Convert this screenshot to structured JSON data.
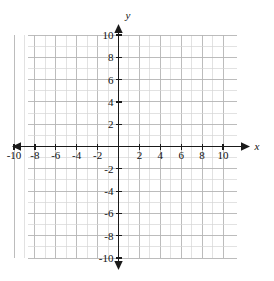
{
  "figure": {
    "kind": "cartesian-coordinate-grid",
    "background_color": "#ffffff",
    "grid_color": "#b5b5b5",
    "grid_color_minor": "#d6d6d6",
    "axis_color": "#1a1a1a",
    "label_color": "#111111"
  },
  "axes": {
    "x": {
      "name": "x",
      "min": -10,
      "max": 10,
      "step": 1,
      "tick_label_step": 2,
      "tick_labels": [
        "-10",
        "-8",
        "-6",
        "-4",
        "-2",
        "2",
        "4",
        "6",
        "8",
        "10"
      ],
      "tick_values": [
        -10,
        -8,
        -6,
        -4,
        -2,
        2,
        4,
        6,
        8,
        10
      ],
      "arrows": "both"
    },
    "y": {
      "name": "y",
      "min": -10,
      "max": 10,
      "step": 1,
      "tick_label_step": 2,
      "tick_labels": [
        "10",
        "8",
        "6",
        "4",
        "2",
        "-2",
        "-4",
        "-6",
        "-8",
        "-10"
      ],
      "tick_values": [
        10,
        8,
        6,
        4,
        2,
        -2,
        -4,
        -6,
        -8,
        -10
      ],
      "arrows": "both"
    }
  },
  "chart_data": {
    "type": "scatter",
    "title": "",
    "xlabel": "x",
    "ylabel": "y",
    "xlim": [
      -10,
      10
    ],
    "ylim": [
      -10,
      10
    ],
    "xticks": [
      -10,
      -8,
      -6,
      -4,
      -2,
      2,
      4,
      6,
      8,
      10
    ],
    "yticks": [
      -10,
      -8,
      -6,
      -4,
      -2,
      2,
      4,
      6,
      8,
      10
    ],
    "grid": true,
    "legend": null,
    "series": [],
    "annotations": []
  }
}
